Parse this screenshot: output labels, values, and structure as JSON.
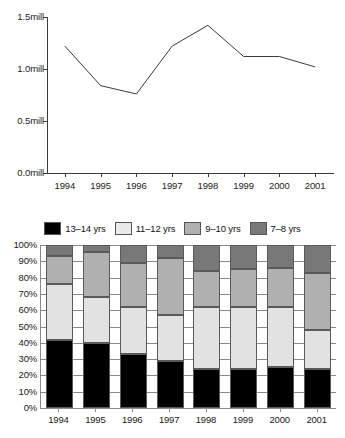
{
  "chart_data": [
    {
      "type": "line",
      "title": "",
      "xlabel": "",
      "ylabel": "",
      "x": [
        "1994",
        "1995",
        "1996",
        "1997",
        "1998",
        "1999",
        "2000",
        "2001"
      ],
      "values": [
        1.22,
        0.84,
        0.76,
        1.22,
        1.42,
        1.12,
        1.12,
        1.02
      ],
      "ylim": [
        0.0,
        1.5
      ],
      "yticks": [
        0.0,
        0.5,
        1.0,
        1.5
      ],
      "ytick_labels": [
        "0.0mill",
        "0.5mill",
        "1.0mill",
        "1.5mill"
      ],
      "grid": false,
      "legend": "none",
      "line_color": "#3a3a3a"
    },
    {
      "type": "bar",
      "subtype": "stacked-100-percent",
      "title": "",
      "xlabel": "",
      "ylabel": "",
      "categories": [
        "1994",
        "1995",
        "1996",
        "1997",
        "1998",
        "1999",
        "2000",
        "2001"
      ],
      "ylim": [
        0,
        100
      ],
      "yticks": [
        0,
        10,
        20,
        30,
        40,
        50,
        60,
        70,
        80,
        90,
        100
      ],
      "ytick_labels": [
        "0%",
        "10%",
        "20%",
        "30%",
        "40%",
        "50%",
        "60%",
        "70%",
        "80%",
        "90%",
        "100%"
      ],
      "grid": true,
      "legend": "top",
      "series": [
        {
          "name": "13–14 yrs",
          "color": "#000000",
          "values": [
            42,
            40,
            33,
            29,
            24,
            24,
            25,
            24
          ]
        },
        {
          "name": "11–12 yrs",
          "color": "#e2e2e2",
          "values": [
            34,
            28,
            29,
            28,
            38,
            38,
            37,
            24
          ]
        },
        {
          "name": "9–10 yrs",
          "color": "#b0b0b0",
          "values": [
            17,
            28,
            27,
            35,
            22,
            23,
            24,
            35
          ]
        },
        {
          "name": "7–8 yrs",
          "color": "#787878",
          "values": [
            7,
            4,
            11,
            8,
            16,
            15,
            14,
            17
          ]
        }
      ],
      "cumulative_tops": {
        "1994": [
          42,
          76,
          93,
          100
        ],
        "1995": [
          40,
          68,
          96,
          100
        ],
        "1996": [
          33,
          62,
          89,
          100
        ],
        "1997": [
          29,
          57,
          92,
          100
        ],
        "1998": [
          24,
          62,
          84,
          100
        ],
        "1999": [
          24,
          62,
          85,
          100
        ],
        "2000": [
          25,
          62,
          86,
          100
        ],
        "2001": [
          24,
          48,
          83,
          100
        ]
      }
    }
  ],
  "legend": {
    "items": [
      {
        "label": "13–14 yrs",
        "color": "#000000"
      },
      {
        "label": "11–12 yrs",
        "color": "#e9e9e9"
      },
      {
        "label": "9–10 yrs",
        "color": "#b0b0b0"
      },
      {
        "label": "7–8 yrs",
        "color": "#787878"
      }
    ]
  }
}
